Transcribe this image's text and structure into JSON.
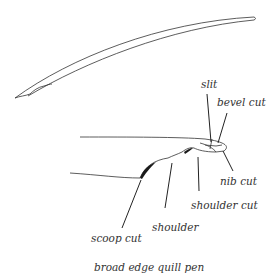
{
  "caption": "broad edge quill pen",
  "labels": {
    "slit": "slit",
    "bevel_cut": "bevel cut",
    "nib_cut": "nib cut",
    "shoulder_cut": "shoulder cut",
    "shoulder": "shoulder",
    "scoop_cut": "scoop cut"
  },
  "colors": {
    "stroke": "#333333",
    "fill": "#1a1a1a",
    "background": "#ffffff"
  }
}
